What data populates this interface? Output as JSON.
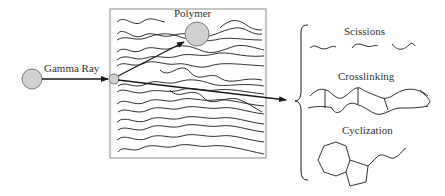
{
  "diagram": {
    "labels": {
      "gamma_ray": "Gamma Ray",
      "polymer": "Polymer",
      "scissions": "Scissions",
      "crosslinking": "Crosslinking",
      "cyclization": "Cyclization"
    },
    "colors": {
      "sphere_fill": "#d0d0d0",
      "sphere_stroke": "#7a7a7a",
      "line": "#1a1a1a",
      "box_stroke": "#8a8a8a"
    },
    "outcomes": [
      "Scissions",
      "Crosslinking",
      "Cyclization"
    ]
  }
}
